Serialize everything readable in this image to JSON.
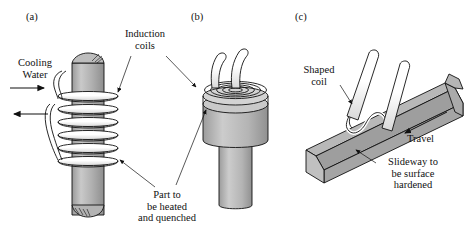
{
  "figure": {
    "background_color": "#ffffff",
    "line_color": "#111111",
    "metal_fill": "#a8a8a8",
    "metal_fill_light": "#c4c4c4",
    "metal_fill_dark": "#8f8f8f",
    "coil_fill": "#ffffff"
  },
  "panels": [
    {
      "id": "(a)",
      "name": "helical-coil-setup",
      "description": "Cylindrical part surrounded by a helical induction coil with cooling water in and out"
    },
    {
      "id": "(b)",
      "name": "pancake-coil-setup",
      "description": "Stepped cylindrical part with flat spiral pancake induction coil on its top face"
    },
    {
      "id": "(c)",
      "name": "shaped-coil-slideway-setup",
      "description": "Shaped coil travelling along a V-section machine-tool slideway being surface hardened"
    }
  ],
  "labels": {
    "cooling_water": {
      "line1": "Cooling",
      "line2": "Water"
    },
    "induction_coils": {
      "line1": "Induction",
      "line2": "coils"
    },
    "part_to_be_heated": {
      "line1": "Part to",
      "line2": "be heated",
      "line3": "and quenched"
    },
    "shaped_coil": {
      "line1": "Shaped",
      "line2": "coil"
    },
    "travel": "Travel",
    "slideway": {
      "line1": "Slideway to",
      "line2": "be surface",
      "line3": "hardened"
    }
  },
  "arrows": {
    "water_in": "arrow-right",
    "water_out": "arrow-left",
    "travel": "arrow-down-left"
  }
}
